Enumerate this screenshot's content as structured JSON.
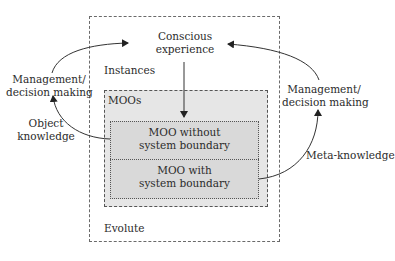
{
  "diagram": {
    "center_top_label": "Conscious\nexperience",
    "center_top_line1": "Conscious",
    "center_top_line2": "experience",
    "outer_box": {
      "top_label": "Instances",
      "bottom_label": "Evolute"
    },
    "moos_box": {
      "label": "MOOs",
      "fill_color": "#e6e6e6",
      "items": [
        {
          "line1": "MOO without",
          "line2": "system boundary"
        },
        {
          "line1": "MOO with",
          "line2": "system boundary"
        }
      ]
    },
    "left_loop": {
      "mgmt_line1": "Management/",
      "mgmt_line2": "decision making",
      "knowledge_line1": "Object",
      "knowledge_line2": "knowledge"
    },
    "right_loop": {
      "mgmt_line1": "Management/",
      "mgmt_line2": "decision making",
      "knowledge_label": "Meta-knowledge"
    },
    "colors": {
      "line": "#333333",
      "dash_border": "#6a6a6a",
      "inner_fill": "#d9d9d9"
    }
  }
}
